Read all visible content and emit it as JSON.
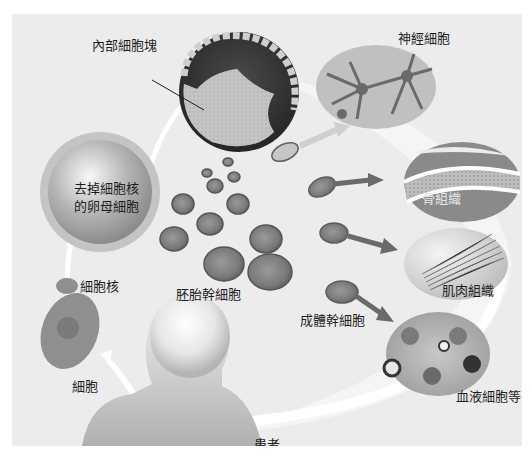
{
  "diagram": {
    "type": "process-cycle",
    "topic": "somatic cell nuclear transfer / stem cell differentiation",
    "colors": {
      "panel_bg": "#ececec",
      "page_bg": "#ffffff",
      "cell_dark": "#6e6e6e",
      "cell_mid": "#8a8a8a",
      "arrow_light": "#ffffff",
      "arrow_dark": "#6a6a6a",
      "text": "#1e1e1e"
    },
    "labels": {
      "inner_cell_mass": "內部細胞塊",
      "enucleated_egg_line1": "去掉細胞核",
      "enucleated_egg_line2": "的卵母細胞",
      "nucleus": "細胞核",
      "cell": "細胞",
      "embryonic_stem_cells": "胚胎幹細胞",
      "adult_stem_cells": "成體幹細胞",
      "patient": "患者"
    },
    "tissues": [
      {
        "id": "nerve",
        "label": "神經細胞"
      },
      {
        "id": "bone",
        "label": "骨組織"
      },
      {
        "id": "muscle",
        "label": "肌肉組織"
      },
      {
        "id": "blood",
        "label": "血液細胞等"
      }
    ],
    "flow": [
      "細胞",
      "細胞核",
      "去掉細胞核的卵母細胞",
      "內部細胞塊",
      "胚胎幹細胞",
      "成體幹細胞",
      "神經細胞 / 骨組織 / 肌肉組織 / 血液細胞等",
      "患者"
    ]
  }
}
